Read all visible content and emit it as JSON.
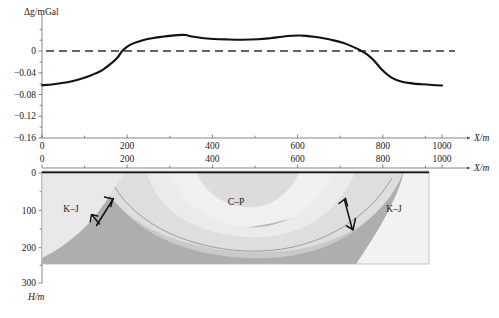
{
  "figure": {
    "title": "",
    "panels": [
      "gravity-anomaly-profile",
      "geological-cross-section"
    ]
  },
  "chart_data": [
    {
      "type": "line",
      "name": "gravity-anomaly-profile",
      "title": "",
      "xlabel": "X/m",
      "ylabel": "Δg/mGal",
      "xlim": [
        0,
        1000
      ],
      "ylim": [
        -0.16,
        0.04
      ],
      "grid": false,
      "legend": "none",
      "xticks": [
        0,
        100,
        200,
        300,
        400,
        500,
        600,
        700,
        800,
        900,
        1000
      ],
      "xtick_labels": [
        "0",
        "",
        "200",
        "",
        "400",
        "",
        "600",
        "",
        "800",
        "",
        "1000"
      ],
      "yticks": [
        0,
        -0.04,
        -0.08,
        -0.12,
        -0.16
      ],
      "ytick_labels": [
        "0",
        "−0.04",
        "−0.08",
        "−0.12",
        "−0.16"
      ],
      "annotations": [
        {
          "text": "zero reference line",
          "type": "dashed-horizontal",
          "y": 0
        }
      ],
      "series": [
        {
          "name": "Δg",
          "x": [
            0,
            25,
            50,
            75,
            100,
            125,
            150,
            175,
            190,
            200,
            215,
            230,
            250,
            275,
            300,
            325,
            350,
            360,
            375,
            400,
            430,
            460,
            500,
            540,
            570,
            600,
            625,
            645,
            660,
            680,
            700,
            725,
            750,
            775,
            790,
            800,
            815,
            830,
            850,
            875,
            900,
            925,
            950,
            975,
            1000
          ],
          "y": [
            -0.063,
            -0.0615,
            -0.059,
            -0.0555,
            -0.0505,
            -0.044,
            -0.0355,
            -0.0215,
            -0.011,
            -0.0005,
            0.009,
            0.0145,
            0.0195,
            0.0235,
            0.0262,
            0.0283,
            0.0297,
            0.0293,
            0.0265,
            0.0238,
            0.0222,
            0.0214,
            0.0208,
            0.0215,
            0.0235,
            0.0263,
            0.0281,
            0.0285,
            0.0279,
            0.0262,
            0.0238,
            0.0202,
            0.0155,
            0.0085,
            0.0035,
            -0.0005,
            -0.0075,
            -0.0175,
            -0.0345,
            -0.0495,
            -0.0565,
            -0.0595,
            -0.0612,
            -0.0625,
            -0.0635
          ]
        }
      ]
    },
    {
      "type": "cross-section",
      "name": "geological-cross-section",
      "title": "",
      "xlabel": "X/m",
      "ylabel": "H/m",
      "xlim": [
        0,
        1000
      ],
      "ylim": [
        0,
        300
      ],
      "depth_axis_direction": "down",
      "xticks": [
        0,
        100,
        200,
        300,
        400,
        500,
        600,
        700,
        800,
        900,
        1000
      ],
      "xtick_labels": [
        "0",
        "",
        "200",
        "",
        "400",
        "",
        "600",
        "",
        "800",
        "",
        "1000"
      ],
      "yticks": [
        0,
        100,
        200,
        300
      ],
      "ytick_labels": [
        "0",
        "100",
        "200",
        "300"
      ],
      "units": [
        {
          "label": "K–J",
          "position": "left-block",
          "description": "Cretaceous–Jurassic",
          "fill": "#ebebeb"
        },
        {
          "label": "C–P",
          "position": "syncline-core",
          "description": "Carboniferous–Permian",
          "fill": "#e2e2e2"
        },
        {
          "label": "K–J",
          "position": "right-block",
          "description": "Cretaceous–Jurassic",
          "fill": "#f0f0f0"
        }
      ],
      "structures": [
        {
          "name": "normal-fault-left",
          "symbol": "fault-arrows",
          "x": 215
        },
        {
          "name": "normal-fault-right",
          "symbol": "fault-arrows",
          "x": 790
        }
      ]
    }
  ],
  "labels": {
    "y_axis_top": "Δg/mGal",
    "x_axis_top": "X/m",
    "x_axis_bottom": "X/m",
    "depth_axis": "H/m",
    "y_ticks_top": [
      "0",
      "−0.04",
      "−0.08",
      "−0.12",
      "−0.16"
    ],
    "x_ticks_top": [
      "0",
      "200",
      "400",
      "600",
      "800",
      "1000"
    ],
    "x_ticks_bottom": [
      "0",
      "200",
      "400",
      "600",
      "800",
      "1000"
    ],
    "depth_ticks": [
      "0",
      "100",
      "200",
      "300"
    ],
    "unit_left": "K–J",
    "unit_core": "C–P",
    "unit_right": "K–J"
  },
  "colors": {
    "curve": "#111111",
    "zero_line": "#333333",
    "axis": "#555555",
    "layer_lightest": "#ededed",
    "layer_light": "#e0e0e0",
    "layer_mid": "#cfcfcf",
    "layer_dark": "#b4b4b4",
    "layer_darkest": "#a8a8a8",
    "block_left": "#ebebeb",
    "block_right": "#f2f2f2"
  }
}
